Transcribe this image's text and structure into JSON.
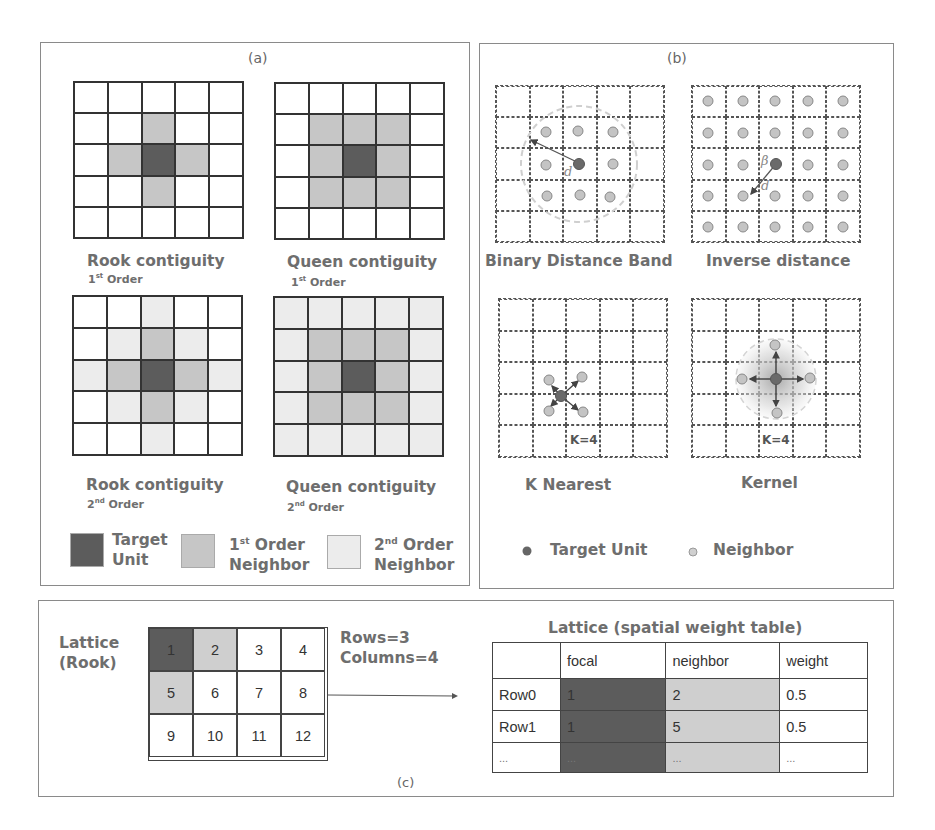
{
  "panel_a": {
    "label": "(a)",
    "diagrams": [
      {
        "title": "Rook contiguity",
        "order_num": "1",
        "order_sup": "st",
        "order_word": "Order",
        "cells": [
          "w",
          "w",
          "w",
          "w",
          "w",
          "w",
          "w",
          "n1",
          "w",
          "w",
          "w",
          "n1",
          "t",
          "n1",
          "w",
          "w",
          "w",
          "n1",
          "w",
          "w",
          "w",
          "w",
          "w",
          "w",
          "w"
        ]
      },
      {
        "title": "Queen contiguity",
        "order_num": "1",
        "order_sup": "st",
        "order_word": "Order",
        "cells": [
          "w",
          "w",
          "w",
          "w",
          "w",
          "w",
          "n1",
          "n1",
          "n1",
          "w",
          "w",
          "n1",
          "t",
          "n1",
          "w",
          "w",
          "n1",
          "n1",
          "n1",
          "w",
          "w",
          "w",
          "w",
          "w",
          "w"
        ]
      },
      {
        "title": "Rook contiguity",
        "order_num": "2",
        "order_sup": "nd",
        "order_word": "Order",
        "cells": [
          "w",
          "w",
          "n2",
          "w",
          "w",
          "w",
          "n2",
          "n1",
          "n2",
          "w",
          "n2",
          "n1",
          "t",
          "n1",
          "n2",
          "w",
          "n2",
          "n1",
          "n2",
          "w",
          "w",
          "w",
          "n2",
          "w",
          "w"
        ]
      },
      {
        "title": "Queen contiguity",
        "order_num": "2",
        "order_sup": "nd",
        "order_word": "Order",
        "cells": [
          "n2",
          "n2",
          "n2",
          "n2",
          "n2",
          "n2",
          "n1",
          "n1",
          "n1",
          "n2",
          "n2",
          "n1",
          "t",
          "n1",
          "n2",
          "n2",
          "n1",
          "n1",
          "n1",
          "n2",
          "n2",
          "n2",
          "n2",
          "n2",
          "n2"
        ]
      }
    ],
    "legend": {
      "target": {
        "line1": "Target",
        "line2": "Unit",
        "color": "#5c5c5c"
      },
      "first": {
        "num": "1",
        "sup": "st",
        "line1": " Order",
        "line2": "Neighbor",
        "color": "#c6c6c6"
      },
      "second": {
        "num": "2",
        "sup": "nd",
        "line1": " Order",
        "line2": "Neighbor",
        "color": "#ececec"
      }
    }
  },
  "panel_b": {
    "label": "(b)",
    "diagrams": [
      {
        "title": "Binary Distance Band",
        "distance_label": "d"
      },
      {
        "title": "Inverse distance",
        "beta_label": "β",
        "distance_label": "d"
      },
      {
        "title": "K Nearest",
        "k_label": "K=4"
      },
      {
        "title": "Kernel",
        "k_label": "K=4"
      }
    ],
    "legend": {
      "target": "Target Unit",
      "neighbor": "Neighbor"
    }
  },
  "panel_c": {
    "label": "(c)",
    "lattice_label_line1": "Lattice",
    "lattice_label_line2": "(Rook)",
    "rows_text": "Rows=3",
    "columns_text": "Columns=4",
    "lattice_cells": [
      "1",
      "2",
      "3",
      "4",
      "5",
      "6",
      "7",
      "8",
      "9",
      "10",
      "11",
      "12"
    ],
    "table_title": "Lattice (spatial weight table)",
    "table": {
      "headers": [
        "",
        "focal",
        "neighbor",
        "weight"
      ],
      "rows": [
        [
          "Row0",
          "1",
          "2",
          "0.5"
        ],
        [
          "Row1",
          "1",
          "5",
          "0.5"
        ],
        [
          "...",
          "...",
          "...",
          "..."
        ]
      ]
    }
  },
  "colors": {
    "target": "#5c5c5c",
    "first_order": "#c6c6c6",
    "second_order": "#ececec",
    "border": "#8a8a8a"
  }
}
